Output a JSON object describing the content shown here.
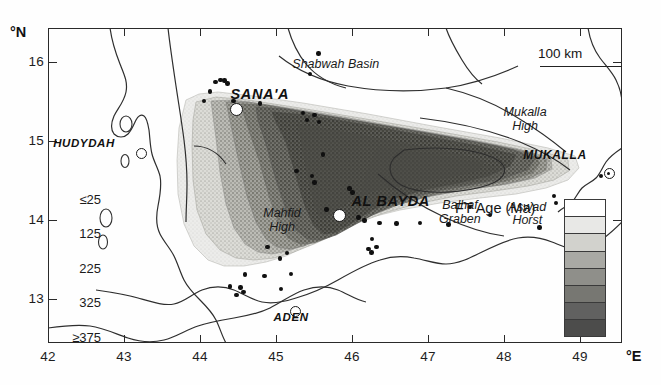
{
  "figure": {
    "type": "geological-map",
    "region": "Yemen — apatite fission track age map"
  },
  "axes": {
    "y_axis_label": "°N",
    "x_axis_label": "°E",
    "y_ticks": [
      "16",
      "15",
      "14",
      "13"
    ],
    "y_tick_values": [
      16,
      15,
      14,
      13
    ],
    "x_ticks": [
      "42",
      "43",
      "44",
      "45",
      "46",
      "47",
      "48",
      "49"
    ],
    "x_tick_values": [
      42,
      43,
      44,
      45,
      46,
      47,
      48,
      49
    ],
    "xlim": [
      41.72,
      49.3
    ],
    "ylim": [
      12.42,
      16.38
    ]
  },
  "scale_bar": {
    "label": "100 km"
  },
  "legend": {
    "title": "FT Age (Ma)",
    "tick_labels": [
      "≤25",
      "125",
      "225",
      "325",
      "≥375"
    ],
    "bands": [
      {
        "label": "≤25",
        "color": "#ffffff"
      },
      {
        "label": "25-125",
        "color": "#e8e8e6"
      },
      {
        "label": "125-175",
        "color": "#d2d2cd"
      },
      {
        "label": "175-225",
        "color": "#a9a9a4"
      },
      {
        "label": "225-275",
        "color": "#8f8f8a"
      },
      {
        "label": "275-325",
        "color": "#777772"
      },
      {
        "label": "325-375",
        "color": "#616160"
      },
      {
        "label": "≥375",
        "color": "#4c4c4b"
      }
    ]
  },
  "cities": [
    {
      "name": "SANA'A",
      "lon": 44.21,
      "lat": 15.35,
      "label_dx": -6,
      "label_dy": -16
    },
    {
      "name": "HUDYDAH",
      "lon": 42.95,
      "lat": 14.8,
      "label_dx": -88,
      "label_dy": -9
    },
    {
      "name": "AL BAYDA",
      "lon": 45.57,
      "lat": 14.02,
      "label_dx": 12,
      "label_dy": -15
    },
    {
      "name": "MUKALLA",
      "lon": 49.13,
      "lat": 14.55,
      "label_dx": -86,
      "label_dy": -18
    },
    {
      "name": "ADEN",
      "lon": 44.99,
      "lat": 12.82,
      "label_dx": -22,
      "label_dy": 8
    }
  ],
  "features": [
    {
      "name": "Shabwah Basin",
      "lon": 45.52,
      "lat": 15.92,
      "lines": [
        "Shabwah Basin"
      ]
    },
    {
      "name": "Mukalla High",
      "lon": 48.02,
      "lat": 15.22,
      "lines": [
        "Mukalla",
        "High"
      ]
    },
    {
      "name": "Mahfid High",
      "lon": 44.81,
      "lat": 13.95,
      "lines": [
        "Mahfid",
        "High"
      ]
    },
    {
      "name": "Balhaf Graben",
      "lon": 47.16,
      "lat": 14.05,
      "lines": [
        "Balhaf",
        "Graben"
      ]
    },
    {
      "name": "Aswad Horst",
      "lon": 48.05,
      "lat": 14.03,
      "lines": [
        "Aswad",
        "Horst"
      ]
    }
  ],
  "sample_points": [
    {
      "lon": 43.93,
      "lat": 15.7
    },
    {
      "lon": 44.0,
      "lat": 15.73
    },
    {
      "lon": 44.05,
      "lat": 15.72
    },
    {
      "lon": 44.09,
      "lat": 15.68
    },
    {
      "lon": 43.86,
      "lat": 15.58
    },
    {
      "lon": 45.29,
      "lat": 16.06
    },
    {
      "lon": 45.18,
      "lat": 15.8
    },
    {
      "lon": 44.17,
      "lat": 15.46
    },
    {
      "lon": 44.52,
      "lat": 15.43
    },
    {
      "lon": 45.09,
      "lat": 15.31
    },
    {
      "lon": 45.24,
      "lat": 15.29
    },
    {
      "lon": 45.3,
      "lat": 15.2
    },
    {
      "lon": 45.14,
      "lat": 15.22
    },
    {
      "lon": 45.35,
      "lat": 14.79
    },
    {
      "lon": 45.21,
      "lat": 14.52
    },
    {
      "lon": 45.24,
      "lat": 14.44
    },
    {
      "lon": 45.7,
      "lat": 14.36
    },
    {
      "lon": 45.74,
      "lat": 14.31
    },
    {
      "lon": 45.4,
      "lat": 14.1
    },
    {
      "lon": 45.82,
      "lat": 14.0
    },
    {
      "lon": 45.9,
      "lat": 13.96
    },
    {
      "lon": 46.1,
      "lat": 13.93
    },
    {
      "lon": 46.32,
      "lat": 13.92
    },
    {
      "lon": 46.63,
      "lat": 13.93
    },
    {
      "lon": 47.01,
      "lat": 13.91
    },
    {
      "lon": 47.29,
      "lat": 14.13
    },
    {
      "lon": 47.56,
      "lat": 14.03
    },
    {
      "lon": 48.21,
      "lat": 13.87
    },
    {
      "lon": 48.43,
      "lat": 14.18
    },
    {
      "lon": 49.02,
      "lat": 14.52
    },
    {
      "lon": 48.4,
      "lat": 14.27
    },
    {
      "lon": 46.0,
      "lat": 13.73
    },
    {
      "lon": 46.06,
      "lat": 13.63
    },
    {
      "lon": 45.95,
      "lat": 13.6
    },
    {
      "lon": 45.99,
      "lat": 13.56
    },
    {
      "lon": 44.78,
      "lat": 13.48
    },
    {
      "lon": 44.32,
      "lat": 13.28
    },
    {
      "lon": 44.58,
      "lat": 13.26
    },
    {
      "lon": 44.93,
      "lat": 13.29
    },
    {
      "lon": 44.12,
      "lat": 13.13
    },
    {
      "lon": 44.26,
      "lat": 13.12
    },
    {
      "lon": 44.3,
      "lat": 13.06
    },
    {
      "lon": 44.21,
      "lat": 13.02
    },
    {
      "lon": 44.8,
      "lat": 13.1
    },
    {
      "lon": 43.78,
      "lat": 15.46
    },
    {
      "lon": 45.0,
      "lat": 14.58
    },
    {
      "lon": 44.62,
      "lat": 13.63
    },
    {
      "lon": 44.88,
      "lat": 13.55
    }
  ]
}
